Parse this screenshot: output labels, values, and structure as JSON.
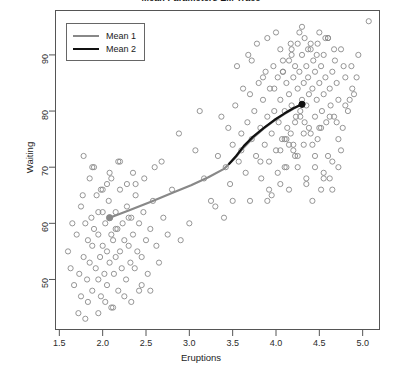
{
  "chart_data": {
    "type": "scatter",
    "title": "Mean Parameters EM Trace",
    "xlabel": "Eruptions",
    "ylabel": "Waiting",
    "xlim": [
      1.45,
      5.2
    ],
    "ylim": [
      41,
      98
    ],
    "xticks": [
      "1.5",
      "2.0",
      "2.5",
      "3.0",
      "3.5",
      "4.0",
      "4.5",
      "5.0"
    ],
    "xtick_values": [
      1.5,
      2.0,
      2.5,
      3.0,
      3.5,
      4.0,
      4.5,
      5.0
    ],
    "yticks": [
      "50",
      "60",
      "70",
      "80",
      "90"
    ],
    "ytick_values": [
      50,
      60,
      70,
      80,
      90
    ],
    "grid": false,
    "legend_position": "top-left",
    "point_style": {
      "marker": "open-circle",
      "radius": 2.6,
      "stroke": "#8a8a8a",
      "stroke_width": 0.9
    },
    "legend": [
      {
        "name": "Mean 1",
        "color": "#888888",
        "width": 2.2
      },
      {
        "name": "Mean 2",
        "color": "#111111",
        "width": 2.2
      }
    ],
    "series": [
      {
        "name": "Mean 1",
        "type": "line",
        "color": "#888888",
        "width": 2.2,
        "endpoint_marker": {
          "x": 2.08,
          "y": 61.0,
          "style": "filled-circle"
        },
        "points": [
          [
            2.08,
            61.0
          ],
          [
            2.3,
            62.3
          ],
          [
            2.55,
            63.8
          ],
          [
            2.8,
            65.4
          ],
          [
            3.02,
            66.8
          ],
          [
            3.22,
            68.2
          ],
          [
            3.4,
            69.7
          ],
          [
            3.52,
            71.5
          ],
          [
            3.62,
            73.4
          ],
          [
            3.74,
            75.3
          ],
          [
            3.86,
            76.9
          ],
          [
            3.98,
            78.3
          ],
          [
            4.1,
            79.5
          ],
          [
            4.2,
            80.4
          ],
          [
            4.3,
            81.2
          ]
        ]
      },
      {
        "name": "Mean 2",
        "type": "line",
        "color": "#111111",
        "width": 2.2,
        "endpoint_marker": {
          "x": 4.3,
          "y": 81.2,
          "style": "filled-circle"
        },
        "points": [
          [
            3.46,
            70.6
          ],
          [
            3.54,
            72.0
          ],
          [
            3.63,
            73.8
          ],
          [
            3.74,
            75.5
          ],
          [
            3.86,
            77.0
          ],
          [
            3.98,
            78.4
          ],
          [
            4.1,
            79.6
          ],
          [
            4.2,
            80.5
          ],
          [
            4.3,
            81.2
          ]
        ]
      }
    ],
    "scatter": {
      "name": "faithful",
      "x": [
        1.6,
        1.63,
        1.67,
        1.7,
        1.73,
        1.75,
        1.75,
        1.78,
        1.8,
        1.82,
        1.83,
        1.83,
        1.85,
        1.87,
        1.88,
        1.88,
        1.9,
        1.92,
        1.93,
        1.95,
        1.95,
        1.97,
        1.98,
        2.0,
        2.0,
        2.02,
        2.03,
        2.05,
        2.05,
        2.07,
        2.08,
        2.1,
        2.1,
        2.12,
        2.13,
        2.15,
        2.15,
        2.17,
        2.18,
        2.2,
        2.2,
        2.22,
        2.23,
        2.25,
        2.27,
        2.28,
        2.3,
        2.32,
        2.33,
        2.35,
        2.37,
        2.38,
        2.4,
        2.42,
        2.45,
        2.47,
        2.5,
        2.52,
        2.55,
        2.58,
        2.62,
        2.65,
        2.7,
        2.75,
        2.8,
        2.9,
        3.0,
        3.07,
        3.17,
        3.25,
        3.33,
        3.37,
        3.42,
        3.45,
        3.47,
        3.5,
        3.53,
        3.57,
        3.6,
        3.62,
        3.65,
        3.67,
        3.7,
        3.72,
        3.75,
        3.77,
        3.8,
        3.82,
        3.83,
        3.85,
        3.87,
        3.88,
        3.9,
        3.92,
        3.93,
        3.95,
        3.97,
        3.98,
        4.0,
        4.02,
        4.03,
        4.05,
        4.05,
        4.07,
        4.08,
        4.1,
        4.1,
        4.12,
        4.13,
        4.15,
        4.15,
        4.17,
        4.18,
        4.18,
        4.2,
        4.2,
        4.22,
        4.23,
        4.25,
        4.25,
        4.27,
        4.28,
        4.3,
        4.3,
        4.32,
        4.33,
        4.33,
        4.35,
        4.35,
        4.37,
        4.38,
        4.4,
        4.4,
        4.42,
        4.43,
        4.45,
        4.45,
        4.47,
        4.48,
        4.5,
        4.5,
        4.52,
        4.53,
        4.55,
        4.55,
        4.57,
        4.58,
        4.6,
        4.62,
        4.63,
        4.65,
        4.67,
        4.68,
        4.7,
        4.72,
        4.75,
        4.77,
        4.8,
        4.83,
        4.87,
        4.9,
        4.95,
        5.07,
        1.72,
        1.8,
        1.95,
        2.03,
        2.12,
        2.25,
        2.33,
        2.42,
        1.85,
        1.9,
        2.0,
        2.08,
        2.18,
        2.28,
        2.38,
        2.48,
        2.6,
        3.55,
        3.68,
        3.78,
        3.9,
        4.0,
        4.08,
        4.17,
        4.27,
        4.37,
        4.47,
        4.57,
        4.67,
        4.78,
        3.95,
        4.05,
        4.15,
        4.25,
        4.35,
        4.45,
        4.55,
        4.65,
        4.75,
        4.12,
        4.22,
        4.32,
        4.42,
        4.52,
        4.62,
        4.72,
        3.85,
        3.72,
        3.6,
        4.3,
        4.4,
        4.5,
        4.6,
        4.18,
        4.08,
        3.98,
        4.88,
        4.93,
        2.68,
        2.88,
        3.12,
        3.3,
        1.65,
        1.77,
        2.15,
        2.3,
        2.05,
        1.95,
        2.45,
        2.55,
        4.35,
        4.45,
        4.25,
        4.15,
        4.55,
        4.65,
        4.05,
        3.9,
        4.7,
        4.8,
        3.5,
        3.4,
        4.85,
        4.6,
        4.48,
        4.38,
        4.28,
        4.2,
        4.1,
        4.02,
        3.92,
        3.82,
        3.7,
        2.35,
        2.2,
        2.1,
        1.98,
        1.88,
        1.78,
        4.42,
        4.52,
        4.62,
        4.72,
        4.32,
        4.22,
        4.12
      ],
      "y": [
        55,
        52,
        49,
        58,
        51,
        63,
        47,
        54,
        60,
        50,
        57,
        46,
        53,
        61,
        48,
        56,
        59,
        52,
        65,
        50,
        58,
        54,
        47,
        62,
        56,
        51,
        60,
        55,
        49,
        64,
        53,
        58,
        45,
        57,
        51,
        62,
        54,
        59,
        48,
        66,
        55,
        52,
        60,
        57,
        50,
        63,
        56,
        53,
        61,
        58,
        52,
        67,
        55,
        60,
        54,
        62,
        57,
        51,
        59,
        64,
        56,
        53,
        61,
        58,
        66,
        57,
        60,
        73,
        68,
        64,
        72,
        79,
        70,
        77,
        67,
        74,
        81,
        71,
        76,
        84,
        69,
        78,
        83,
        75,
        80,
        72,
        85,
        77,
        68,
        82,
        74,
        87,
        79,
        71,
        84,
        76,
        88,
        80,
        73,
        86,
        78,
        91,
        82,
        75,
        87,
        80,
        70,
        85,
        77,
        89,
        83,
        76,
        90,
        81,
        86,
        74,
        88,
        79,
        92,
        84,
        87,
        80,
        82,
        90,
        85,
        78,
        93,
        88,
        81,
        86,
        83,
        91,
        76,
        84,
        89,
        87,
        79,
        82,
        92,
        85,
        77,
        88,
        80,
        90,
        83,
        86,
        78,
        93,
        84,
        81,
        87,
        79,
        89,
        85,
        82,
        91,
        77,
        86,
        80,
        88,
        83,
        90,
        96,
        44,
        43,
        44,
        46,
        45,
        47,
        46,
        48,
        68,
        70,
        66,
        69,
        71,
        67,
        65,
        68,
        70,
        88,
        90,
        92,
        93,
        94,
        87,
        92,
        94,
        91,
        90,
        93,
        91,
        88,
        65,
        67,
        66,
        70,
        68,
        72,
        69,
        71,
        73,
        75,
        78,
        76,
        74,
        77,
        79,
        75,
        86,
        89,
        73,
        95,
        92,
        94,
        93,
        91,
        89,
        84,
        84,
        86,
        71,
        76,
        80,
        63,
        60,
        65,
        59,
        61,
        67,
        62,
        49,
        48,
        67,
        70,
        72,
        74,
        68,
        66,
        73,
        64,
        78,
        81,
        64,
        61,
        82,
        72,
        75,
        77,
        79,
        73,
        75,
        69,
        66,
        71,
        64,
        69,
        71,
        68,
        66,
        70,
        72,
        64,
        66,
        68,
        70,
        74,
        72,
        70
      ]
    }
  },
  "axes": {
    "xlabel": "Eruptions",
    "ylabel": "Waiting"
  }
}
